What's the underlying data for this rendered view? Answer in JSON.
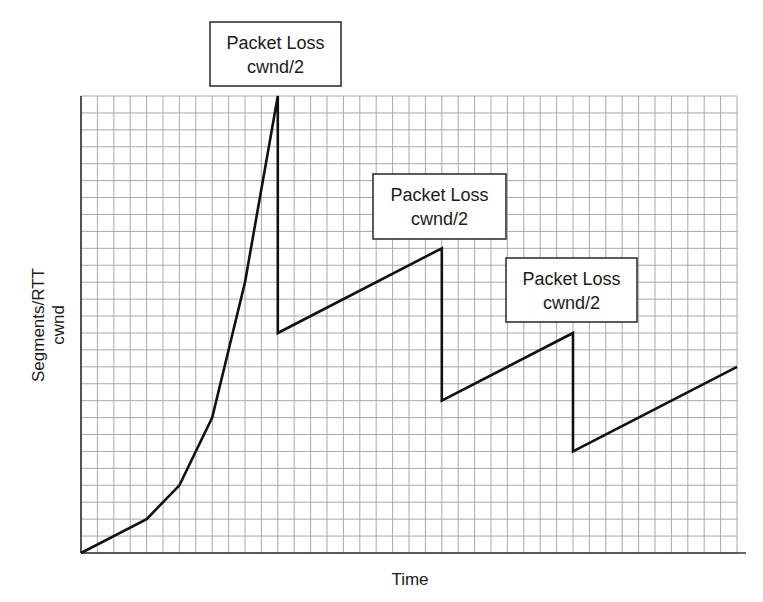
{
  "chart_data": {
    "type": "line",
    "title": "",
    "xlabel": "Time",
    "ylabel": [
      "Segments/RTT",
      "cwnd"
    ],
    "grid": true,
    "legend": null,
    "x_units": "grid cells",
    "y_units": "grid cells",
    "xlim": [
      0,
      40
    ],
    "ylim": [
      0,
      27
    ],
    "series": [
      {
        "name": "cwnd",
        "x": [
          0,
          4,
          6,
          8,
          10,
          12,
          12,
          22,
          22,
          30,
          30,
          40
        ],
        "y": [
          0,
          2,
          4,
          8,
          16,
          27,
          13,
          18,
          9,
          13,
          6,
          11
        ]
      }
    ],
    "annotations": [
      {
        "line1": "Packet Loss",
        "line2": "cwnd/2",
        "at_x": 12
      },
      {
        "line1": "Packet Loss",
        "line2": "cwnd/2",
        "at_x": 22
      },
      {
        "line1": "Packet Loss",
        "line2": "cwnd/2",
        "at_x": 30
      }
    ]
  },
  "labels": {
    "x_axis": "Time",
    "y_axis_line1": "Segments/RTT",
    "y_axis_line2": "cwnd"
  },
  "annotations": [
    {
      "line1": "Packet Loss",
      "line2": "cwnd/2"
    },
    {
      "line1": "Packet Loss",
      "line2": "cwnd/2"
    },
    {
      "line1": "Packet Loss",
      "line2": "cwnd/2"
    }
  ],
  "colors": {
    "line": "#111111",
    "grid": "#a9a9a9",
    "axis": "#333333",
    "background": "#ffffff"
  }
}
